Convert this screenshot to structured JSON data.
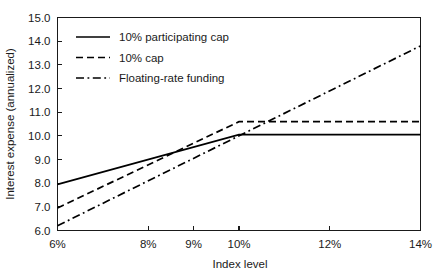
{
  "chart_data": {
    "type": "line",
    "title": "",
    "xlabel": "Index level",
    "ylabel": "Interest expense (annualized)",
    "xlim": [
      6,
      14
    ],
    "ylim": [
      6.0,
      15.0
    ],
    "grid": false,
    "legend_position": "top-left",
    "xticks": [
      6,
      8,
      9,
      10,
      12,
      14
    ],
    "xticklabels": [
      "6%",
      "8%",
      "9%",
      "10%",
      "12%",
      "14%"
    ],
    "yticks": [
      6.0,
      7.0,
      8.0,
      9.0,
      10.0,
      11.0,
      12.0,
      13.0,
      14.0,
      15.0
    ],
    "yticklabels": [
      "6.0",
      "7.0",
      "8.0",
      "9.0",
      "10.0",
      "11.0",
      "12.0",
      "13.0",
      "14.0",
      "15.0"
    ],
    "series": [
      {
        "name": "10% participating cap",
        "style": "solid",
        "color": "#000000",
        "x": [
          6,
          10,
          14
        ],
        "values": [
          7.95,
          10.05,
          10.05
        ]
      },
      {
        "name": "10% cap",
        "style": "dashed",
        "color": "#000000",
        "x": [
          6,
          10,
          14
        ],
        "values": [
          6.95,
          10.6,
          10.6
        ]
      },
      {
        "name": "Floating-rate funding",
        "style": "dash-dot",
        "color": "#000000",
        "x": [
          6,
          14
        ],
        "values": [
          6.2,
          13.8
        ]
      }
    ]
  },
  "legend": {
    "entries": [
      {
        "label": "10% participating cap"
      },
      {
        "label": "10% cap"
      },
      {
        "label": "Floating-rate funding"
      }
    ]
  },
  "axes": {
    "x_title": "Index level",
    "y_title": "Interest expense (annualized)"
  }
}
